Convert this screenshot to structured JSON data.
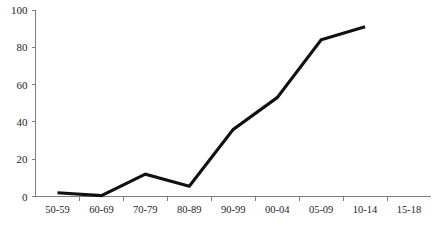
{
  "chart_data": {
    "type": "line",
    "title": "",
    "subtitle": "",
    "xlabel": "",
    "ylabel": "",
    "categories": [
      "50-59",
      "60-69",
      "70-79",
      "80-89",
      "90-99",
      "00-04",
      "05-09",
      "10-14",
      "15-18"
    ],
    "series": [
      {
        "name": "series-1",
        "color": "#111111",
        "values": [
          2,
          0.5,
          12,
          5.5,
          36,
          53,
          84,
          91,
          null
        ]
      }
    ],
    "ylim": [
      0,
      100
    ],
    "y_ticks": [
      0,
      20,
      40,
      60,
      80,
      100
    ],
    "y_tick_labels": [
      "0",
      "20",
      "40",
      "60",
      "80",
      "100"
    ],
    "grid": false,
    "legend": false,
    "legend_position": "none",
    "axis_color": "#7d7d7d",
    "background_color": "#ffffff"
  },
  "axes": {
    "y_labels": [
      "100",
      "80",
      "60",
      "40",
      "20",
      "0"
    ],
    "x_labels": [
      "50-59",
      "60-69",
      "70-79",
      "80-89",
      "90-99",
      "00-04",
      "05-09",
      "10-14",
      "15-18"
    ]
  },
  "header": {
    "clipped_title_fragment": ""
  }
}
